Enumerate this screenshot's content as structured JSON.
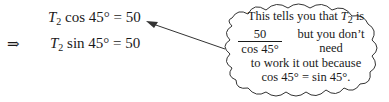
{
  "equations": [
    {
      "lhs_var": "T",
      "lhs_sub": "2",
      "func": " cos 45° = 50"
    },
    {
      "prefix": "⇒",
      "lhs_var": "T",
      "lhs_sub": "2",
      "func": " sin 45° = 50"
    }
  ],
  "callout": {
    "line1_pre": "This tells you that ",
    "line1_var": "T",
    "line1_sub": "2",
    "line1_post": " is",
    "frac_num": "50",
    "frac_den": "cos 45°",
    "line2_post": "but you don’t need",
    "line3": "to work it out because",
    "line4": "cos 45° = sin 45°."
  }
}
